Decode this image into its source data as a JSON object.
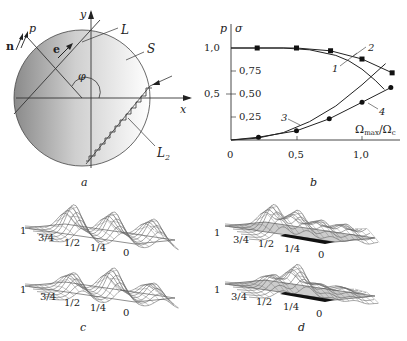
{
  "panels": {
    "a": {
      "caption": "a",
      "labels": {
        "n": "n",
        "p": "p",
        "e": "e",
        "y": "y",
        "x": "x",
        "L": "L",
        "S": "S",
        "phi": "φ",
        "L2": "L",
        "L2_sub": "2"
      }
    },
    "b": {
      "caption": "b",
      "axis": {
        "y_left_label": "p",
        "y_right_label": "σ",
        "x_label_main": "Ω",
        "x_label_sub1": "max",
        "x_label_slash": "/Ω",
        "x_label_sub2": "c",
        "y_left_ticks": [
          "1,0",
          "0,5"
        ],
        "y_right_ticks": [
          "0,75",
          "0,50",
          "0,25"
        ],
        "x_ticks": [
          "0",
          "0,5",
          "1,0"
        ]
      },
      "curve_labels": [
        "1",
        "2",
        "3",
        "4"
      ]
    },
    "c": {
      "caption": "c",
      "ticks": [
        "1",
        "3/4",
        "1/2",
        "1/4",
        "0"
      ]
    },
    "d": {
      "caption": "d",
      "ticks": [
        "1",
        "3/4",
        "1/2",
        "1/4",
        "0"
      ]
    }
  },
  "chart_data": {
    "type": "line",
    "title": "",
    "xlabel": "Ωmax/Ωc",
    "ylabel": "p | σ",
    "xlim": [
      0,
      1.3
    ],
    "ylim": [
      0,
      1.05
    ],
    "x_ticks": [
      0,
      0.5,
      1.0
    ],
    "y_ticks_left": [
      0.5,
      1.0
    ],
    "y_ticks_right": [
      0.25,
      0.5,
      0.75
    ],
    "grid": false,
    "series": [
      {
        "name": "1",
        "marker": "none",
        "x": [
          0,
          0.2,
          0.4,
          0.6,
          0.8,
          0.9,
          1.0,
          1.1,
          1.17
        ],
        "y": [
          1.0,
          1.0,
          1.0,
          0.98,
          0.92,
          0.86,
          0.77,
          0.65,
          0.55
        ]
      },
      {
        "name": "2",
        "marker": "square",
        "x": [
          0,
          0.2,
          0.5,
          0.76,
          1.0,
          1.23
        ],
        "y": [
          1.0,
          1.0,
          1.0,
          0.97,
          0.88,
          0.73
        ]
      },
      {
        "name": "3",
        "marker": "none",
        "x": [
          0,
          0.2,
          0.4,
          0.6,
          0.8,
          1.0,
          1.18
        ],
        "y": [
          0,
          0.02,
          0.08,
          0.2,
          0.37,
          0.6,
          0.83
        ]
      },
      {
        "name": "4",
        "marker": "circle",
        "x": [
          0,
          0.21,
          0.5,
          0.75,
          1.0,
          1.22
        ],
        "y": [
          0,
          0.03,
          0.1,
          0.23,
          0.41,
          0.57
        ]
      }
    ]
  }
}
